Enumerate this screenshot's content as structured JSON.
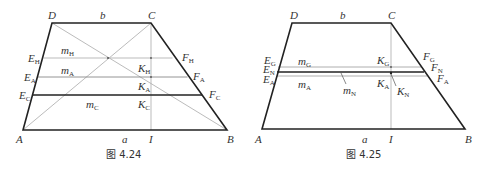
{
  "figures": [
    {
      "caption": "图 4.24",
      "labels": {
        "D": "D",
        "b": "b",
        "C": "C",
        "E_H": "E",
        "E_H_sub": "H",
        "m_H": "m",
        "m_H_sub": "H",
        "F_H": "F",
        "F_H_sub": "H",
        "K_H": "K",
        "K_H_sub": "H",
        "E_A": "E",
        "E_A_sub": "A",
        "m_A": "m",
        "m_A_sub": "A",
        "F_A": "F",
        "F_A_sub": "A",
        "K_A": "K",
        "K_A_sub": "A",
        "E_C": "E",
        "E_C_sub": "C",
        "m_C": "m",
        "m_C_sub": "C",
        "F_C": "F",
        "F_C_sub": "C",
        "K_C": "K",
        "K_C_sub": "C",
        "A": "A",
        "a": "a",
        "I": "I",
        "B": "B"
      }
    },
    {
      "caption": "图 4.25",
      "labels": {
        "D": "D",
        "b": "b",
        "C": "C",
        "E_G": "E",
        "E_G_sub": "G",
        "m_G": "m",
        "m_G_sub": "G",
        "F_G": "F",
        "F_G_sub": "G",
        "K_G": "K",
        "K_G_sub": "G",
        "E_N": "E",
        "E_N_sub": "N",
        "F_N": "F",
        "F_N_sub": "N",
        "m_N": "m",
        "m_N_sub": "N",
        "K_N": "K",
        "K_N_sub": "N",
        "E_A": "E",
        "E_A_sub": "A",
        "m_A": "m",
        "m_A_sub": "A",
        "F_A": "F",
        "F_A_sub": "A",
        "K_A": "K",
        "K_A_sub": "A",
        "A": "A",
        "a": "a",
        "I": "I",
        "B": "B"
      }
    }
  ],
  "colors": {
    "thick_line": "#222222",
    "thin_line": "#aaaaaa",
    "text": "#333333"
  }
}
